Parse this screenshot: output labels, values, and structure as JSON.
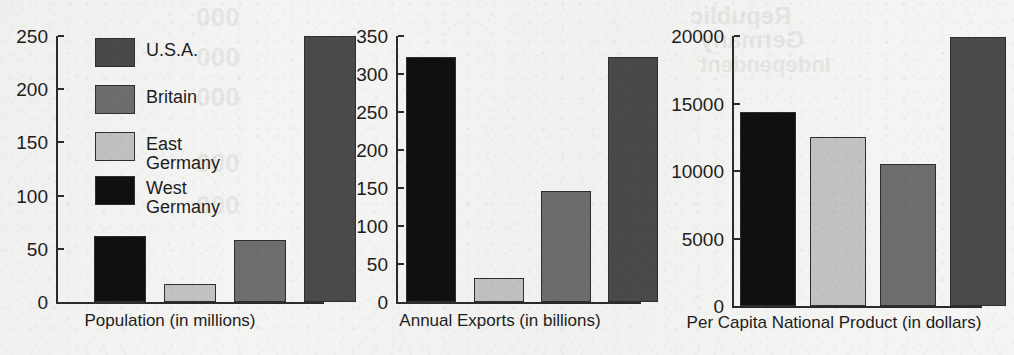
{
  "figure": {
    "background_color": "#f4f4f2",
    "ink_color": "#1d1d1d",
    "axis_color": "#2b2b2b"
  },
  "legend": {
    "position": "inside-panel-1-upper-left",
    "entries": [
      {
        "label": "U.S.A.",
        "color": "#4a4a4a",
        "swatch_name": "legend-swatch-usa"
      },
      {
        "label": "Britain",
        "color": "#6e6e6e",
        "swatch_name": "legend-swatch-britain"
      },
      {
        "label": "East\nGermany",
        "color": "#c2c2c2",
        "swatch_name": "legend-swatch-east-germany"
      },
      {
        "label": "West\nGermany",
        "color": "#101010",
        "swatch_name": "legend-swatch-west-germany"
      }
    ]
  },
  "bleed_through": [
    {
      "text": "000",
      "x": 196,
      "y": 2,
      "size": 26
    },
    {
      "text": "000",
      "x": 196,
      "y": 42,
      "size": 26
    },
    {
      "text": "000",
      "x": 196,
      "y": 82,
      "size": 26
    },
    {
      "text": "000",
      "x": 196,
      "y": 148,
      "size": 26
    },
    {
      "text": "000",
      "x": 196,
      "y": 190,
      "size": 26
    },
    {
      "text": "Republic",
      "x": 690,
      "y": 2,
      "size": 24
    },
    {
      "text": "Germany",
      "x": 700,
      "y": 26,
      "size": 24
    },
    {
      "text": "Independent",
      "x": 700,
      "y": 52,
      "size": 22
    }
  ],
  "chart_data": [
    {
      "type": "bar",
      "title": "Population (in millions)",
      "xlabel": "Population (in millions)",
      "ylabel": "",
      "ylim": [
        0,
        250
      ],
      "yticks": [
        0,
        50,
        100,
        150,
        200,
        250
      ],
      "ytick_labels": [
        "0",
        "50",
        "100",
        "150",
        "200",
        "250"
      ],
      "grid": false,
      "categories": [
        "West Germany",
        "East Germany",
        "Britain",
        "U.S.A."
      ],
      "values": [
        62,
        17,
        58,
        250
      ],
      "colors": [
        "#101010",
        "#c2c2c2",
        "#6e6e6e",
        "#4a4a4a"
      ]
    },
    {
      "type": "bar",
      "title": "Annual Exports (in billions)",
      "xlabel": "Annual Exports (in billions)",
      "ylabel": "",
      "ylim": [
        0,
        350
      ],
      "yticks": [
        0,
        50,
        100,
        150,
        200,
        250,
        300,
        350
      ],
      "ytick_labels": [
        "0",
        "50",
        "100",
        "150",
        "200",
        "250",
        "300",
        "350"
      ],
      "grid": false,
      "categories": [
        "West Germany",
        "East Germany",
        "Britain",
        "U.S.A."
      ],
      "values": [
        323,
        31,
        146,
        323
      ],
      "colors": [
        "#101010",
        "#c2c2c2",
        "#6e6e6e",
        "#4a4a4a"
      ]
    },
    {
      "type": "bar",
      "title": "Per Capita National Product (in dollars)",
      "xlabel": "Per Capita National Product (in dollars)",
      "ylabel": "",
      "ylim": [
        0,
        20000
      ],
      "yticks": [
        0,
        5000,
        10000,
        15000,
        20000
      ],
      "ytick_labels": [
        "0",
        "5000",
        "10000",
        "15000",
        "20000"
      ],
      "grid": false,
      "categories": [
        "West Germany",
        "East Germany",
        "Britain",
        "U.S.A."
      ],
      "values": [
        14400,
        12500,
        10500,
        19900
      ],
      "colors": [
        "#101010",
        "#c2c2c2",
        "#6e6e6e",
        "#4a4a4a"
      ]
    }
  ]
}
